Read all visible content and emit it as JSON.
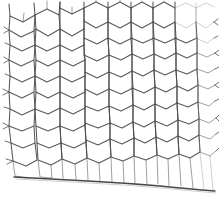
{
  "figure": {
    "subject": "hexagonal wire netting",
    "alt_names": [
      "chicken wire",
      "poultry netting",
      "hexagonal mesh"
    ],
    "rendering_style": "line engraving on white background",
    "width_px": 219,
    "height_px": 197
  },
  "colors": {
    "background": "#ffffff",
    "wire_primary": "#4a4a4a",
    "wire_light": "#6e6e6e",
    "wire_faint": "#8d8d8d",
    "selvage": "#3d3d3d"
  },
  "mesh": {
    "orientation": "flat-top hexagons in staggered vertical columns",
    "columns": 8,
    "rows": 7,
    "cell_width_left_px": 26,
    "cell_width_right_px": 21,
    "cell_height_left_px": 25,
    "cell_height_right_px": 21,
    "taper": "cells shrink slightly toward the right edge (perspective)",
    "left_margin_px": 8,
    "right_margin_px": 4,
    "top_crop": "top row of cells is cut by the upper image edge",
    "bottom_feature": "curved horizontal selvage wire closes the lower edge"
  },
  "selvage": {
    "label": "bottom selvage wire",
    "y_left_px": 177,
    "y_center_px": 182,
    "y_right_px": 191,
    "curve": "gently sagging then dropping toward the right"
  },
  "edge_stubs": {
    "left_label": "cut wire ends at left edge",
    "right_label": "cut wire ends at right edge",
    "left_count": 7,
    "right_count": 8,
    "stub_length_px": 5
  },
  "caption": "Hexagonal wire netting"
}
